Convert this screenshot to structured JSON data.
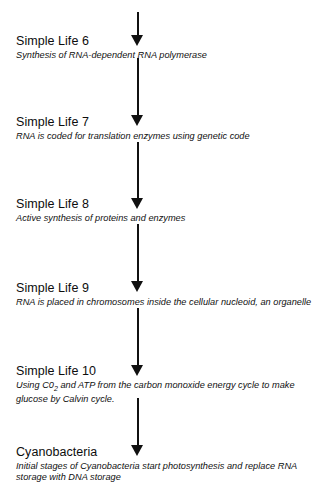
{
  "diagram": {
    "background_color": "#ffffff",
    "arrow_color": "#111111",
    "text_color": "#0d0d0d",
    "steps": [
      {
        "title": "Simple Life 6",
        "description": "Synthesis of RNA-dependent RNA polymerase"
      },
      {
        "title": "Simple Life 7",
        "description": "RNA is coded for translation enzymes using genetic code"
      },
      {
        "title": "Simple Life 8",
        "description": "Active synthesis of proteins and enzymes"
      },
      {
        "title": "Simple Life 9",
        "description": "RNA is placed in chromosomes inside the cellular nucleoid, an organelle"
      },
      {
        "title": "Simple Life 10",
        "description_prefix": "Using C0",
        "description_subscript": "2",
        "description_suffix": " and ATP from the carbon monoxide energy cycle to make glucose by Calvin cycle."
      },
      {
        "title": "Cyanobacteria",
        "description": "Initial stages of Cyanobacteria start photosynthesis and replace RNA storage with DNA storage"
      }
    ],
    "connectors": [
      {
        "name": "arrow-into-step-1"
      },
      {
        "name": "arrow-step-1-to-2"
      },
      {
        "name": "arrow-step-2-to-3"
      },
      {
        "name": "arrow-step-3-to-4"
      },
      {
        "name": "arrow-step-4-to-5"
      },
      {
        "name": "arrow-step-5-to-6"
      }
    ]
  }
}
